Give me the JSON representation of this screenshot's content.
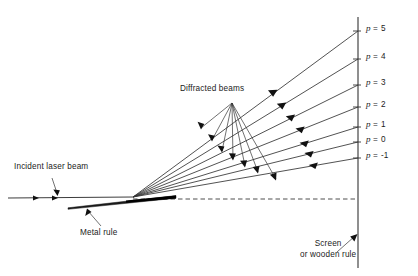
{
  "figure": {
    "type": "optics-ray-diagram",
    "background_color": "#ffffff",
    "line_color": "#262626",
    "text_color": "#1b1b1b"
  },
  "annotations": {
    "incident_beam": {
      "label": "Incident laser beam",
      "x": 14,
      "y": 166
    },
    "diffracted_beams": {
      "label": "Diffracted beams",
      "x": 180,
      "y": 88
    },
    "metal_rule": {
      "label": "Metal rule",
      "x": 80,
      "y": 232
    },
    "screen": {
      "line1": "Screen",
      "line2": "or wooden rule",
      "x": 300,
      "y": 243
    }
  },
  "orders": [
    {
      "label": "p = 5",
      "symbol": "p",
      "equals": "=",
      "value": "5",
      "screen_y": 31,
      "label_x": 366,
      "label_y": 27
    },
    {
      "label": "p = 4",
      "symbol": "p",
      "equals": "=",
      "value": "4",
      "screen_y": 59,
      "label_x": 366,
      "label_y": 55
    },
    {
      "label": "p = 3",
      "symbol": "p",
      "equals": "=",
      "value": "3",
      "screen_y": 85,
      "label_x": 366,
      "label_y": 81
    },
    {
      "label": "p = 2",
      "symbol": "p",
      "equals": "=",
      "value": "2",
      "screen_y": 107,
      "label_x": 366,
      "label_y": 103
    },
    {
      "label": "p = 1",
      "symbol": "p",
      "equals": "=",
      "value": "1",
      "screen_y": 127,
      "label_x": 366,
      "label_y": 123
    },
    {
      "label": "p = 0",
      "symbol": "p",
      "equals": "=",
      "value": "0",
      "screen_y": 142,
      "label_x": 366,
      "label_y": 138
    },
    {
      "label": "p = -1",
      "symbol": "p",
      "equals": "=",
      "value": "-1",
      "screen_y": 158,
      "label_x": 366,
      "label_y": 154
    }
  ],
  "geometry": {
    "origin_x": 133,
    "origin_y": 197,
    "screen_x": 358,
    "screen_top_y": 17,
    "screen_bottom_y": 268,
    "incident_start_x": 8,
    "incident_y": 198,
    "dashed_line_y": 199,
    "rule_left_x": 68,
    "rule_left_y": 207,
    "rule_right_x": 176,
    "rule_right_y": 196
  }
}
